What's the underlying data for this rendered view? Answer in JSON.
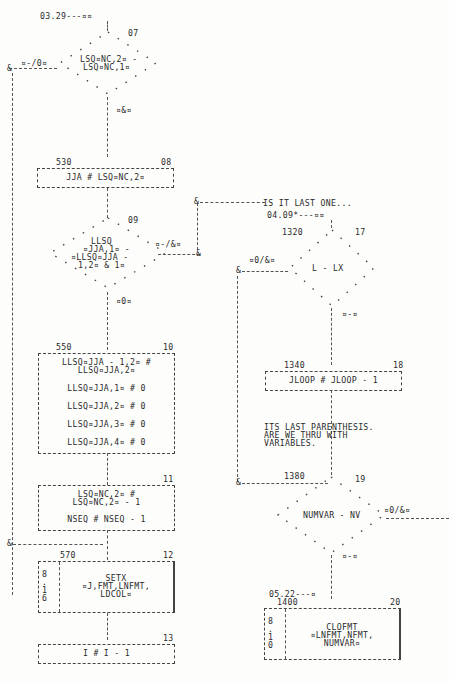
{
  "left_column": {
    "entry_connector": "03.29---¤¤",
    "node_07": {
      "number": "07",
      "type": "decision",
      "lines": [
        "LSQ¤NC,2¤ -",
        "LSQ¤NC,1¤"
      ],
      "branch_left": "¤-/0¤",
      "branch_down": "¤&¤"
    },
    "node_08": {
      "label": "530",
      "number": "08",
      "type": "process",
      "lines": [
        "JJA # LSQ¤NC,2¤"
      ]
    },
    "node_09": {
      "number": "09",
      "type": "decision",
      "lines": [
        "LLSQ",
        "¤JJA,1¤ -",
        "¤LLSQ¤JJA -",
        "1,2¤ & 1¤"
      ],
      "branch_right": "¤-/&¤",
      "branch_down": "¤0¤"
    },
    "node_10": {
      "label": "550",
      "number": "10",
      "type": "process",
      "lines": [
        "LLSQ¤JJA - 1,2¤ #",
        "LLSQ¤JJA,2¤",
        "LLSQ¤JJA,1¤ # 0",
        "LLSQ¤JJA,2¤ # 0",
        "LLSQ¤JJA,3¤ # 0",
        "LLSQ¤JJA,4¤ # 0"
      ]
    },
    "node_11": {
      "number": "11",
      "type": "process",
      "lines": [
        "LSQ¤NC,2¤ #",
        "LSQ¤NC,2¤ - 1",
        "NSEQ # NSEQ - 1"
      ]
    },
    "node_12": {
      "label": "570",
      "number": "12",
      "type": "subroutine",
      "side_ref": [
        "8",
        ".",
        "1",
        "6"
      ],
      "lines": [
        "SETX",
        "¤J,FMT,LNFMT,",
        "LDCOL¤"
      ]
    },
    "node_13": {
      "number": "13",
      "type": "process",
      "lines": [
        "I # I - 1"
      ]
    }
  },
  "right_column": {
    "comment_1": "IS IT LAST ONE...",
    "entry_connector": "04.09*---¤¤",
    "node_17": {
      "label": "1320",
      "number": "17",
      "type": "decision",
      "lines": [
        "L - LX"
      ],
      "branch_left": "¤0/&¤",
      "branch_down": "¤-¤"
    },
    "node_18": {
      "label": "1340",
      "number": "18",
      "type": "process",
      "lines": [
        "JLOOP # JLOOP - 1"
      ]
    },
    "comment_2": [
      "ITS LAST PARENTHESIS.",
      "ARE WE THRU WITH",
      "VARIABLES."
    ],
    "node_19": {
      "label": "1380",
      "number": "19",
      "type": "decision",
      "lines": [
        "NUMVAR - NV"
      ],
      "branch_right": "¤0/&¤",
      "branch_down": "¤-¤"
    },
    "exit_connector": "05.22---¤",
    "node_20": {
      "label": "1400",
      "number": "20",
      "type": "subroutine",
      "side_ref": [
        "8",
        ".",
        "1",
        "0"
      ],
      "lines": [
        "CLOFMT",
        "¤LNFMT,NFMT,",
        "NUMVAR¤"
      ]
    }
  }
}
